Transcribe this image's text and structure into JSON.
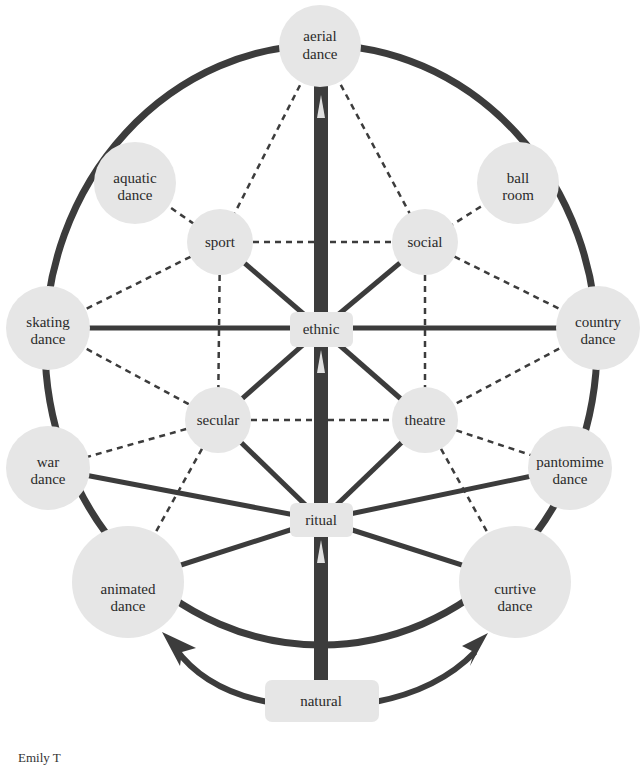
{
  "diagram": {
    "colors": {
      "node_fill": "#e6e6e6",
      "line_dark": "#3c3c3c",
      "background": "#ffffff",
      "arrow_tip": "#d8d8d8"
    },
    "nodes": {
      "aerial": {
        "line1": "aerial",
        "line2": "dance"
      },
      "aquatic": {
        "line1": "aquatic",
        "line2": "dance"
      },
      "ballroom": {
        "line1": "ball",
        "line2": "room"
      },
      "sport": {
        "line1": "sport"
      },
      "social": {
        "line1": "social"
      },
      "skating": {
        "line1": "skating",
        "line2": "dance"
      },
      "ethnic": {
        "line1": "ethnic"
      },
      "country": {
        "line1": "country",
        "line2": "dance"
      },
      "secular": {
        "line1": "secular"
      },
      "theatre": {
        "line1": "theatre"
      },
      "war": {
        "line1": "war",
        "line2": "dance"
      },
      "pantomime": {
        "line1": "pantomime",
        "line2": "dance"
      },
      "ritual": {
        "line1": "ritual"
      },
      "animated": {
        "line1": "animated",
        "line2": "dance"
      },
      "curtive": {
        "line1": "curtive",
        "line2": "dance"
      },
      "natural": {
        "line1": "natural"
      }
    },
    "footer": {
      "text": "Emily T"
    }
  }
}
